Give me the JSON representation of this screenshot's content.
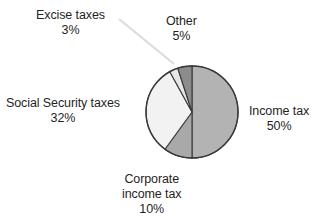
{
  "chart_data": {
    "type": "pie",
    "title": "",
    "subtitle": "",
    "xlabel": "",
    "ylabel": "",
    "legend_position": "none",
    "grid": false,
    "units": "percent",
    "total": 100,
    "categories": [
      "Income tax",
      "Corporate income tax",
      "Social Security taxes",
      "Excise taxes",
      "Other"
    ],
    "values": [
      50,
      10,
      32,
      3,
      5
    ],
    "slices": [
      {
        "label": "Income tax",
        "value": 50,
        "value_text": "50%",
        "color": "#b3b3b3",
        "start_angle": 0,
        "end_angle": 180
      },
      {
        "label": "Corporate income tax",
        "value": 10,
        "value_text": "10%",
        "color": "#a9a9a9",
        "start_angle": 180,
        "end_angle": 216
      },
      {
        "label": "Social Security taxes",
        "value": 32,
        "value_text": "32%",
        "color": "#f2f2f2",
        "start_angle": 216,
        "end_angle": 331.2
      },
      {
        "label": "Excise taxes",
        "value": 3,
        "value_text": "3%",
        "color": "#e6e6e6",
        "start_angle": 331.2,
        "end_angle": 342
      },
      {
        "label": "Other",
        "value": 5,
        "value_text": "5%",
        "color": "#8c8c8c",
        "start_angle": 342,
        "end_angle": 360
      }
    ]
  },
  "labels": {
    "excise": {
      "name": "Excise taxes",
      "pct": "3%"
    },
    "other": {
      "name": "Other",
      "pct": "5%"
    },
    "social": {
      "name": "Social Security taxes",
      "pct": "32%"
    },
    "income": {
      "name": "Income tax",
      "pct": "50%"
    },
    "corporate": {
      "name_line1": "Corporate",
      "name_line2": "income tax",
      "pct": "10%"
    }
  },
  "geometry": {
    "center_x": 192,
    "center_y": 112,
    "radius": 46,
    "outline_color": "#3a3a3a",
    "leader_color": "#dcdcdc"
  }
}
